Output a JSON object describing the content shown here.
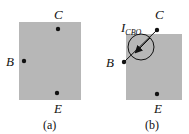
{
  "colors": {
    "block_fill": "#b7b7b7",
    "ink": "#111111",
    "background": "#ffffff"
  },
  "panel_a": {
    "caption": "(a)",
    "terminals": {
      "collector": "C",
      "base": "B",
      "emitter": "E"
    }
  },
  "panel_b": {
    "caption": "(b)",
    "terminals": {
      "collector": "C",
      "base": "B",
      "emitter": "E"
    },
    "current_source": {
      "symbol": "I",
      "subscript": "CBO",
      "direction": "collector-to-base"
    }
  }
}
